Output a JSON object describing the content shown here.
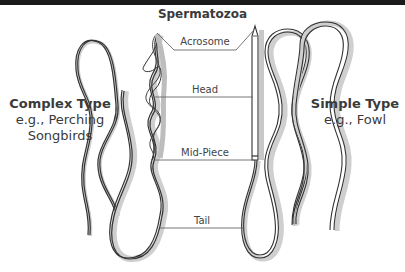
{
  "diagram": {
    "title": "Spermatozoa",
    "parts": [
      {
        "label": "Acrosome"
      },
      {
        "label": "Head"
      },
      {
        "label": "Mid-Piece"
      },
      {
        "label": "Tail"
      }
    ],
    "left_type": {
      "name": "Complex Type",
      "example_line1": "e.g., Perching",
      "example_line2": "Songbirds"
    },
    "right_type": {
      "name": "Simple Type",
      "example_line1": "e.g., Fowl"
    },
    "colors": {
      "topbar": "#1a1a1a",
      "outline": "#333333",
      "shadow": "#c8c8c8",
      "leader_line": "#666666",
      "text": "#3a3a3a"
    }
  }
}
